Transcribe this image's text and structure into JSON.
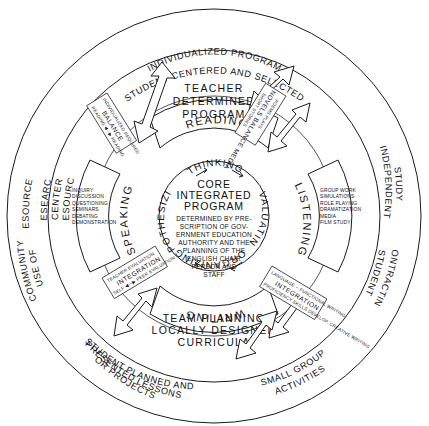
{
  "diagram": {
    "core": {
      "heading_lines": [
        "CORE",
        "INTEGRATED",
        "PROGRAM"
      ],
      "top_word": "THINKING",
      "body_lines": [
        "DETERMINED BY PRE-",
        "SCRIPTION OF GOV-",
        "ERNMENT EDUCATION",
        "AUTHORITY AND THE",
        "PLANNING OF THE",
        "ENGLISH CHAIR",
        "PERSON AND",
        "STAFF"
      ],
      "ring_words": {
        "right": "EVALUATING",
        "bottom": "ORGANIZING",
        "left": "HYPOTHESIZING"
      }
    },
    "outer_ring": {
      "top_line_1": "INDIVIDUALIZED PROGRAM",
      "top_line_2": "STUDENT CENTERED AND SELECTED",
      "right_line_1": "INDEPENDENT",
      "right_line_2": "STUDY",
      "right_line_3": "STUDENT",
      "right_line_4": "CONTRACTING",
      "bottom_right_1": "SMALL GROUP",
      "bottom_right_2": "ACTIVITIES",
      "bottom_left_1": "STUDENT PLANNED AND",
      "bottom_left_2": "PRESENTED LESSONS",
      "bottom_left_3": "OR PROJECTS",
      "left_line_1": "RESOURCE",
      "left_line_2": "CENTER",
      "left_line_3": "RESEARCH",
      "left_line_4": "USE OF",
      "left_line_5": "COMMUNITY",
      "left_line_6": "RESOURCES"
    },
    "quadrants": {
      "reading": {
        "name": "READING",
        "heading_lines": [
          "TEACHER",
          "DETERMINED",
          "PROGRAM"
        ]
      },
      "writing": {
        "name": "WRITING",
        "heading_lines": [
          "TEAM PLANNING",
          "LOCALLY DESIGNED",
          "CURRICULA"
        ]
      },
      "speaking": {
        "name": "SPEAKING",
        "items": [
          "INQUIRY",
          "DISCUSSION",
          "QUESTIONING",
          "SEMINARS",
          "DEBATING",
          "DEMONSTRATION"
        ]
      },
      "listening": {
        "name": "LISTENING",
        "items": [
          "GROUP WORK",
          "SIMULATIONS",
          "ROLE PLAYING",
          "DRAMATIZATION",
          "MEDIA",
          "FILM STUDY"
        ]
      }
    },
    "balance_boxes": {
      "reading_left": {
        "top": "INDIVIDUALIZED  REQUIRED",
        "middle": "BALANCE",
        "bottom": "READING ◀─▶ READING"
      },
      "reading_right": {
        "top": "POEMS  PLAYS",
        "middle": "NOVELS  BALANCE  MEDIA",
        "bottom": "SHORT STORIES"
      },
      "writing_left": {
        "top": "TEACHER EVALUATION",
        "middle": "INTEGRATION",
        "bottom": "SELF ◀─▶ PEER EVALUATION"
      },
      "writing_right": {
        "top": "LANGUAGE ─ FUNCTIONAL WRITING",
        "middle": "INTEGRATION",
        "bottom": "PROFICIENCY  SKILLS DEVELOP. CREATIVE WRITING"
      }
    },
    "colors": {
      "ink": "#1a1a1a",
      "paper": "#ffffff"
    }
  }
}
